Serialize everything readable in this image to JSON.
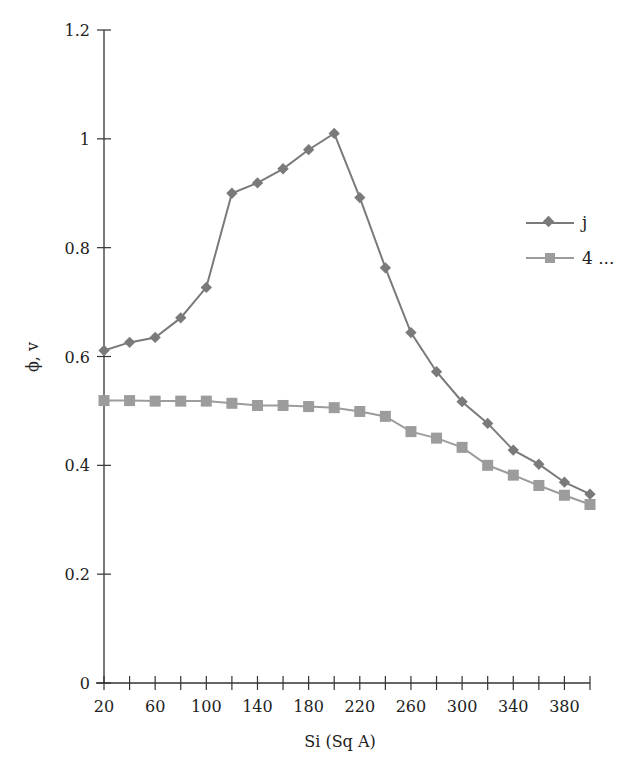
{
  "chart_data": {
    "type": "line",
    "title": "",
    "xlabel": "Si (Sq A)",
    "ylabel": "ϕ, v",
    "ylim": [
      0,
      1.2
    ],
    "yticks": [
      "0",
      "0.2",
      "0.4",
      "0.6",
      "0.8",
      "1",
      "1.2"
    ],
    "ytick_values": [
      0,
      0.2,
      0.4,
      0.6,
      0.8,
      1.0,
      1.2
    ],
    "x": [
      20,
      40,
      60,
      80,
      100,
      120,
      140,
      160,
      180,
      200,
      220,
      240,
      260,
      280,
      300,
      320,
      340,
      360,
      380,
      400
    ],
    "xtick_labels": [
      "20",
      "60",
      "100",
      "140",
      "180",
      "220",
      "260",
      "300",
      "340",
      "380"
    ],
    "xtick_label_values": [
      20,
      60,
      100,
      140,
      180,
      220,
      260,
      300,
      340,
      380
    ],
    "grid": false,
    "legend_position": "right",
    "series": [
      {
        "name": "j",
        "marker": "diamond",
        "color": "#7a7a7a",
        "values": [
          0.611,
          0.626,
          0.635,
          0.671,
          0.727,
          0.9,
          0.919,
          0.945,
          0.98,
          1.01,
          0.892,
          0.763,
          0.644,
          0.572,
          0.517,
          0.477,
          0.428,
          0.402,
          0.369,
          0.347
        ]
      },
      {
        "name": "4 ...",
        "marker": "square",
        "color": "#9c9c9c",
        "values": [
          0.519,
          0.519,
          0.518,
          0.518,
          0.518,
          0.514,
          0.51,
          0.51,
          0.508,
          0.506,
          0.499,
          0.49,
          0.462,
          0.45,
          0.433,
          0.4,
          0.382,
          0.363,
          0.345,
          0.328
        ]
      }
    ]
  },
  "legend": {
    "items": [
      {
        "label": "j"
      },
      {
        "label": "4 ..."
      }
    ]
  },
  "axes": {
    "x_title": "Si (Sq A)",
    "y_title": "ϕ, v"
  }
}
